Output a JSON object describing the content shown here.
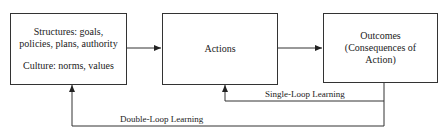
{
  "diagram": {
    "type": "flow",
    "nodes": [
      {
        "id": "structures",
        "lines": [
          "Structures: goals,",
          "policies, plans, authority"
        ],
        "lines2": [
          "Culture: norms, values"
        ]
      },
      {
        "id": "actions",
        "lines": [
          "Actions"
        ]
      },
      {
        "id": "outcomes",
        "lines": [
          "Outcomes",
          "(Consequences of",
          "Action)"
        ]
      }
    ],
    "edges": [
      {
        "from": "structures",
        "to": "actions",
        "label": ""
      },
      {
        "from": "actions",
        "to": "outcomes",
        "label": ""
      },
      {
        "from": "outcomes",
        "to": "actions",
        "label": "Single-Loop Learning"
      },
      {
        "from": "outcomes",
        "to": "structures",
        "label": "Double-Loop Learning"
      }
    ],
    "labels": {
      "single_loop": "Single-Loop Learning",
      "double_loop": "Double-Loop Learning"
    },
    "colors": {
      "line": "#333333",
      "background": "#ffffff"
    }
  }
}
